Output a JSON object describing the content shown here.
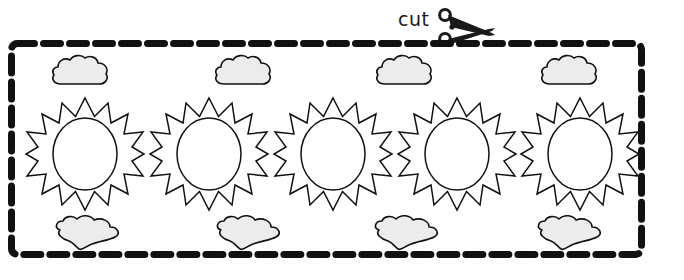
{
  "page": {
    "title": "Sun and Clouds Cut-Out Worksheet",
    "background_color": "#ffffff",
    "width": 684,
    "height": 280
  },
  "cut_guide": {
    "label": "cut",
    "icon": "scissors-icon",
    "label_color": "#1a1a1a",
    "border": {
      "style": "dashed",
      "color": "#111111",
      "stroke_width": 7,
      "dash_length": 17,
      "gap_length": 9,
      "corner_radius": 6,
      "x": 8,
      "y": 40,
      "width": 637,
      "height": 218
    }
  },
  "artwork": {
    "outline_color": "#111111",
    "cloud_fill_color": "#ececec",
    "sun_fill_color": "#ffffff",
    "sun_ray_count": 16,
    "clouds_top": [
      {
        "name": "cloud-top-1",
        "x": 49,
        "cx": 80
      },
      {
        "name": "cloud-top-2",
        "x": 212,
        "cx": 243
      },
      {
        "name": "cloud-top-3",
        "x": 373,
        "cx": 404
      },
      {
        "name": "cloud-top-4",
        "x": 538,
        "cx": 569
      }
    ],
    "clouds_bottom": [
      {
        "name": "cloud-bottom-1",
        "x": 52,
        "cx": 87
      },
      {
        "name": "cloud-bottom-2",
        "x": 213,
        "cx": 248
      },
      {
        "name": "cloud-bottom-3",
        "x": 371,
        "cx": 406
      },
      {
        "name": "cloud-bottom-4",
        "x": 534,
        "cx": 569
      }
    ],
    "suns": [
      {
        "name": "sun-1",
        "x": 24
      },
      {
        "name": "sun-2",
        "x": 148
      },
      {
        "name": "sun-3",
        "x": 272
      },
      {
        "name": "sun-4",
        "x": 396
      },
      {
        "name": "sun-5",
        "x": 519
      }
    ]
  }
}
